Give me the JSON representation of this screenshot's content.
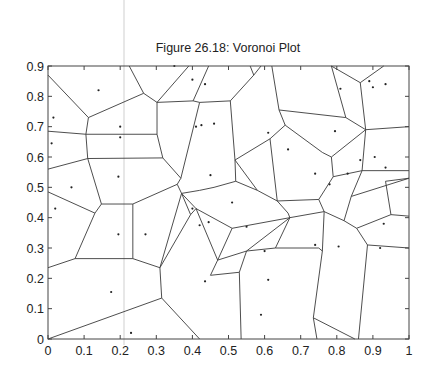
{
  "chart_data": {
    "type": "scatter",
    "subtype": "voronoi",
    "title": "Figure 26.18: Voronoi Plot",
    "xlabel": "",
    "ylabel": "",
    "xlim": [
      0,
      1
    ],
    "ylim": [
      0,
      0.9
    ],
    "grid": false,
    "legend": null,
    "xticks": [
      0,
      0.1,
      0.2,
      0.3,
      0.4,
      0.5,
      0.6,
      0.7,
      0.8,
      0.9,
      1
    ],
    "xtick_labels": [
      "0",
      "0.1",
      "0.2",
      "0.3",
      "0.4",
      "0.5",
      "0.6",
      "0.7",
      "0.8",
      "0.9",
      "1"
    ],
    "yticks": [
      0,
      0.1,
      0.2,
      0.3,
      0.4,
      0.5,
      0.6,
      0.7,
      0.8,
      0.9
    ],
    "ytick_labels": [
      "0",
      "0.1",
      "0.2",
      "0.3",
      "0.4",
      "0.5",
      "0.6",
      "0.7",
      "0.8",
      "0.9"
    ],
    "sites": [
      [
        0.015,
        0.73
      ],
      [
        0.01,
        0.645
      ],
      [
        0.14,
        0.82
      ],
      [
        0.2,
        0.7
      ],
      [
        0.2,
        0.665
      ],
      [
        0.065,
        0.5
      ],
      [
        0.195,
        0.535
      ],
      [
        0.02,
        0.43
      ],
      [
        0.195,
        0.345
      ],
      [
        0.27,
        0.345
      ],
      [
        0.175,
        0.155
      ],
      [
        0.23,
        0.02
      ],
      [
        0.35,
        0.9
      ],
      [
        0.4,
        0.855
      ],
      [
        0.435,
        0.84
      ],
      [
        0.41,
        0.7
      ],
      [
        0.425,
        0.705
      ],
      [
        0.46,
        0.71
      ],
      [
        0.45,
        0.54
      ],
      [
        0.51,
        0.45
      ],
      [
        0.4,
        0.43
      ],
      [
        0.42,
        0.375
      ],
      [
        0.445,
        0.385
      ],
      [
        0.435,
        0.19
      ],
      [
        0.61,
        0.68
      ],
      [
        0.665,
        0.625
      ],
      [
        0.6,
        0.29
      ],
      [
        0.61,
        0.195
      ],
      [
        0.74,
        0.31
      ],
      [
        0.805,
        0.305
      ],
      [
        0.93,
        0.38
      ],
      [
        0.92,
        0.3
      ],
      [
        0.81,
        0.825
      ],
      [
        0.89,
        0.85
      ],
      [
        0.9,
        0.83
      ],
      [
        0.935,
        0.84
      ],
      [
        0.795,
        0.685
      ],
      [
        0.74,
        0.545
      ],
      [
        0.78,
        0.51
      ],
      [
        0.83,
        0.545
      ],
      [
        0.865,
        0.59
      ],
      [
        0.905,
        0.6
      ],
      [
        0.935,
        0.565
      ],
      [
        0.59,
        0.08
      ],
      [
        0.55,
        0.37
      ]
    ],
    "edges": [
      [
        [
          0.0,
          0.87
        ],
        [
          0.112,
          0.73
        ]
      ],
      [
        [
          0.112,
          0.73
        ],
        [
          0.265,
          0.81
        ]
      ],
      [
        [
          0.265,
          0.81
        ],
        [
          0.225,
          0.9
        ]
      ],
      [
        [
          0.265,
          0.81
        ],
        [
          0.302,
          0.78
        ]
      ],
      [
        [
          0.302,
          0.78
        ],
        [
          0.39,
          0.9
        ]
      ],
      [
        [
          0.302,
          0.78
        ],
        [
          0.402,
          0.785
        ]
      ],
      [
        [
          0.402,
          0.785
        ],
        [
          0.445,
          0.9
        ]
      ],
      [
        [
          0.402,
          0.785
        ],
        [
          0.42,
          0.78
        ]
      ],
      [
        [
          0.42,
          0.78
        ],
        [
          0.505,
          0.785
        ]
      ],
      [
        [
          0.505,
          0.785
        ],
        [
          0.57,
          0.87
        ]
      ],
      [
        [
          0.57,
          0.87
        ],
        [
          0.56,
          0.9
        ]
      ],
      [
        [
          0.57,
          0.87
        ],
        [
          0.59,
          0.9
        ]
      ],
      [
        [
          0.0,
          0.685
        ],
        [
          0.105,
          0.675
        ]
      ],
      [
        [
          0.112,
          0.73
        ],
        [
          0.105,
          0.675
        ]
      ],
      [
        [
          0.105,
          0.675
        ],
        [
          0.302,
          0.675
        ]
      ],
      [
        [
          0.302,
          0.675
        ],
        [
          0.302,
          0.78
        ]
      ],
      [
        [
          0.105,
          0.675
        ],
        [
          0.11,
          0.595
        ]
      ],
      [
        [
          0.302,
          0.675
        ],
        [
          0.318,
          0.597
        ]
      ],
      [
        [
          0.11,
          0.595
        ],
        [
          0.318,
          0.597
        ]
      ],
      [
        [
          0.0,
          0.56
        ],
        [
          0.11,
          0.595
        ]
      ],
      [
        [
          0.11,
          0.595
        ],
        [
          0.148,
          0.445
        ]
      ],
      [
        [
          0.318,
          0.597
        ],
        [
          0.368,
          0.53
        ]
      ],
      [
        [
          0.368,
          0.53
        ],
        [
          0.42,
          0.78
        ]
      ],
      [
        [
          0.368,
          0.53
        ],
        [
          0.358,
          0.51
        ]
      ],
      [
        [
          0.0,
          0.485
        ],
        [
          0.13,
          0.415
        ]
      ],
      [
        [
          0.13,
          0.415
        ],
        [
          0.148,
          0.445
        ]
      ],
      [
        [
          0.148,
          0.445
        ],
        [
          0.235,
          0.445
        ]
      ],
      [
        [
          0.235,
          0.445
        ],
        [
          0.358,
          0.51
        ]
      ],
      [
        [
          0.235,
          0.445
        ],
        [
          0.235,
          0.265
        ]
      ],
      [
        [
          0.13,
          0.415
        ],
        [
          0.075,
          0.265
        ]
      ],
      [
        [
          0.0,
          0.235
        ],
        [
          0.075,
          0.265
        ]
      ],
      [
        [
          0.075,
          0.265
        ],
        [
          0.235,
          0.265
        ]
      ],
      [
        [
          0.235,
          0.265
        ],
        [
          0.31,
          0.235
        ]
      ],
      [
        [
          0.358,
          0.51
        ],
        [
          0.37,
          0.48
        ]
      ],
      [
        [
          0.37,
          0.48
        ],
        [
          0.31,
          0.235
        ]
      ],
      [
        [
          0.31,
          0.235
        ],
        [
          0.315,
          0.135
        ]
      ],
      [
        [
          0.0,
          0.0
        ],
        [
          0.315,
          0.135
        ]
      ],
      [
        [
          0.315,
          0.135
        ],
        [
          0.42,
          0.0
        ]
      ],
      [
        [
          0.37,
          0.48
        ],
        [
          0.42,
          0.49
        ]
      ],
      [
        [
          0.42,
          0.49
        ],
        [
          0.46,
          0.5
        ]
      ],
      [
        [
          0.46,
          0.5
        ],
        [
          0.52,
          0.52
        ]
      ],
      [
        [
          0.52,
          0.52
        ],
        [
          0.58,
          0.49
        ]
      ],
      [
        [
          0.58,
          0.49
        ],
        [
          0.635,
          0.455
        ]
      ],
      [
        [
          0.635,
          0.455
        ],
        [
          0.665,
          0.415
        ]
      ],
      [
        [
          0.665,
          0.415
        ],
        [
          0.67,
          0.4
        ]
      ],
      [
        [
          0.37,
          0.48
        ],
        [
          0.41,
          0.43
        ]
      ],
      [
        [
          0.41,
          0.43
        ],
        [
          0.51,
          0.365
        ]
      ],
      [
        [
          0.51,
          0.365
        ],
        [
          0.67,
          0.4
        ]
      ],
      [
        [
          0.41,
          0.43
        ],
        [
          0.47,
          0.26
        ]
      ],
      [
        [
          0.47,
          0.26
        ],
        [
          0.51,
          0.365
        ]
      ],
      [
        [
          0.47,
          0.26
        ],
        [
          0.55,
          0.29
        ]
      ],
      [
        [
          0.55,
          0.29
        ],
        [
          0.67,
          0.4
        ]
      ],
      [
        [
          0.37,
          0.48
        ],
        [
          0.395,
          0.41
        ]
      ],
      [
        [
          0.395,
          0.41
        ],
        [
          0.41,
          0.43
        ]
      ],
      [
        [
          0.31,
          0.235
        ],
        [
          0.395,
          0.41
        ]
      ],
      [
        [
          0.47,
          0.26
        ],
        [
          0.45,
          0.21
        ]
      ],
      [
        [
          0.45,
          0.21
        ],
        [
          0.53,
          0.22
        ]
      ],
      [
        [
          0.53,
          0.22
        ],
        [
          0.55,
          0.29
        ]
      ],
      [
        [
          0.53,
          0.22
        ],
        [
          0.535,
          0.0
        ]
      ],
      [
        [
          0.55,
          0.29
        ],
        [
          0.63,
          0.3
        ]
      ],
      [
        [
          0.63,
          0.3
        ],
        [
          0.67,
          0.4
        ]
      ],
      [
        [
          0.63,
          0.3
        ],
        [
          0.75,
          0.3
        ]
      ],
      [
        [
          0.75,
          0.3
        ],
        [
          0.76,
          0.29
        ]
      ],
      [
        [
          0.52,
          0.52
        ],
        [
          0.518,
          0.59
        ]
      ],
      [
        [
          0.518,
          0.59
        ],
        [
          0.505,
          0.785
        ]
      ],
      [
        [
          0.518,
          0.59
        ],
        [
          0.58,
          0.49
        ]
      ],
      [
        [
          0.518,
          0.59
        ],
        [
          0.615,
          0.66
        ]
      ],
      [
        [
          0.615,
          0.66
        ],
        [
          0.657,
          0.705
        ]
      ],
      [
        [
          0.657,
          0.705
        ],
        [
          0.64,
          0.755
        ]
      ],
      [
        [
          0.64,
          0.755
        ],
        [
          0.62,
          0.9
        ]
      ],
      [
        [
          0.64,
          0.755
        ],
        [
          0.825,
          0.73
        ]
      ],
      [
        [
          0.825,
          0.73
        ],
        [
          0.785,
          0.9
        ]
      ],
      [
        [
          0.825,
          0.73
        ],
        [
          0.88,
          0.69
        ]
      ],
      [
        [
          0.88,
          0.69
        ],
        [
          1.0,
          0.7
        ]
      ],
      [
        [
          0.88,
          0.69
        ],
        [
          0.865,
          0.845
        ]
      ],
      [
        [
          0.865,
          0.845
        ],
        [
          0.785,
          0.9
        ]
      ],
      [
        [
          0.865,
          0.845
        ],
        [
          0.93,
          0.9
        ]
      ],
      [
        [
          0.657,
          0.705
        ],
        [
          0.76,
          0.615
        ]
      ],
      [
        [
          0.76,
          0.615
        ],
        [
          0.785,
          0.6
        ]
      ],
      [
        [
          0.785,
          0.6
        ],
        [
          0.88,
          0.69
        ]
      ],
      [
        [
          0.615,
          0.66
        ],
        [
          0.635,
          0.455
        ]
      ],
      [
        [
          0.785,
          0.6
        ],
        [
          0.79,
          0.535
        ]
      ],
      [
        [
          0.79,
          0.535
        ],
        [
          0.87,
          0.555
        ]
      ],
      [
        [
          0.87,
          0.555
        ],
        [
          0.88,
          0.69
        ]
      ],
      [
        [
          0.87,
          0.555
        ],
        [
          1.0,
          0.555
        ]
      ],
      [
        [
          0.79,
          0.535
        ],
        [
          0.75,
          0.46
        ]
      ],
      [
        [
          0.75,
          0.46
        ],
        [
          0.635,
          0.455
        ]
      ],
      [
        [
          0.75,
          0.46
        ],
        [
          0.765,
          0.42
        ]
      ],
      [
        [
          0.765,
          0.42
        ],
        [
          0.82,
          0.39
        ]
      ],
      [
        [
          0.82,
          0.39
        ],
        [
          0.84,
          0.47
        ]
      ],
      [
        [
          0.84,
          0.47
        ],
        [
          0.87,
          0.555
        ]
      ],
      [
        [
          0.84,
          0.47
        ],
        [
          1.0,
          0.53
        ]
      ],
      [
        [
          0.765,
          0.42
        ],
        [
          0.67,
          0.4
        ]
      ],
      [
        [
          0.82,
          0.39
        ],
        [
          0.855,
          0.365
        ]
      ],
      [
        [
          0.855,
          0.365
        ],
        [
          0.885,
          0.31
        ]
      ],
      [
        [
          0.885,
          0.31
        ],
        [
          1.0,
          0.3
        ]
      ],
      [
        [
          0.855,
          0.365
        ],
        [
          0.95,
          0.41
        ]
      ],
      [
        [
          0.95,
          0.41
        ],
        [
          1.0,
          0.405
        ]
      ],
      [
        [
          0.885,
          0.31
        ],
        [
          0.86,
          0.0
        ]
      ],
      [
        [
          0.765,
          0.42
        ],
        [
          0.76,
          0.29
        ]
      ],
      [
        [
          0.76,
          0.29
        ],
        [
          0.735,
          0.07
        ]
      ],
      [
        [
          0.735,
          0.07
        ],
        [
          0.85,
          0.0
        ]
      ],
      [
        [
          0.735,
          0.07
        ],
        [
          0.745,
          0.0
        ]
      ],
      [
        [
          0.95,
          0.41
        ],
        [
          0.935,
          0.52
        ]
      ],
      [
        [
          0.935,
          0.52
        ],
        [
          1.0,
          0.53
        ]
      ]
    ]
  }
}
